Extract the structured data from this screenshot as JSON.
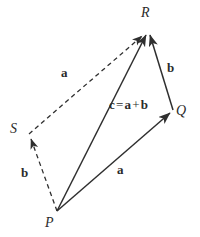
{
  "figure": {
    "type": "vector-addition-parallelogram-diagram",
    "background_color": "#ffffff",
    "stroke_color": "#2f2f2f",
    "text_color": "#2b2b2b"
  },
  "points": [
    {
      "id": "P",
      "label": "P",
      "x": 57,
      "y": 211,
      "label_x": 45,
      "label_y": 216
    },
    {
      "id": "Q",
      "label": "Q",
      "x": 173,
      "y": 111,
      "label_x": 176,
      "label_y": 105
    },
    {
      "id": "R",
      "label": "R",
      "x": 147,
      "y": 32,
      "label_x": 141,
      "label_y": 6
    },
    {
      "id": "S",
      "label": "S",
      "x": 29,
      "y": 134,
      "label_x": 10,
      "label_y": 122
    }
  ],
  "edges": [
    {
      "id": "PQ",
      "from": "P",
      "to": "Q",
      "style": "solid",
      "arrow": "end",
      "vector_label": "a",
      "label_x": 117,
      "label_y": 163
    },
    {
      "id": "QR",
      "from": "Q",
      "to": "R",
      "style": "solid",
      "arrow": "end",
      "vector_label": "b",
      "label_x": 167,
      "label_y": 61
    },
    {
      "id": "PR",
      "from": "P",
      "to": "R",
      "style": "solid",
      "arrow": "end",
      "vector_label": "c = a + b",
      "label_x": 109,
      "label_y": 98
    },
    {
      "id": "PS",
      "from": "P",
      "to": "S",
      "style": "dashed",
      "arrow": "end",
      "vector_label": "b",
      "label_x": 21,
      "label_y": 166
    },
    {
      "id": "SR",
      "from": "S",
      "to": "R",
      "style": "dashed",
      "arrow": "end",
      "vector_label": "a",
      "label_x": 61,
      "label_y": 66
    }
  ],
  "expression": {
    "lhs": "c",
    "equals": "=",
    "term1": "a",
    "plus": "+",
    "term2": "b"
  }
}
